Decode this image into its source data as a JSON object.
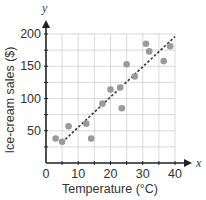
{
  "chart_data": {
    "type": "scatter",
    "title": "",
    "xlabel": "Temperature (°C)",
    "ylabel": "Ice-cream sales ($)",
    "x_axis_var": "x",
    "y_axis_var": "y",
    "xlim": [
      0,
      40
    ],
    "ylim": [
      0,
      200
    ],
    "x_ticks": [
      0,
      10,
      20,
      30,
      40
    ],
    "y_ticks": [
      50,
      100,
      150,
      200
    ],
    "grid": true,
    "grid_step_x": 5,
    "grid_step_y": 25,
    "legend": null,
    "series": [
      {
        "name": "Observations",
        "color": "#9a9a9a",
        "points": [
          {
            "x": 3,
            "y": 38
          },
          {
            "x": 5,
            "y": 33
          },
          {
            "x": 7,
            "y": 57
          },
          {
            "x": 12.5,
            "y": 61
          },
          {
            "x": 14,
            "y": 38
          },
          {
            "x": 17.5,
            "y": 92
          },
          {
            "x": 20,
            "y": 114
          },
          {
            "x": 23,
            "y": 117
          },
          {
            "x": 23.5,
            "y": 85
          },
          {
            "x": 25,
            "y": 153
          },
          {
            "x": 27.5,
            "y": 134
          },
          {
            "x": 31,
            "y": 185
          },
          {
            "x": 32,
            "y": 173
          },
          {
            "x": 36.5,
            "y": 158
          },
          {
            "x": 38.5,
            "y": 181
          }
        ]
      }
    ],
    "trend_line": {
      "style": "dashed",
      "color": "#333333",
      "from": {
        "x": 5,
        "y": 32
      },
      "to": {
        "x": 40,
        "y": 196
      }
    }
  }
}
